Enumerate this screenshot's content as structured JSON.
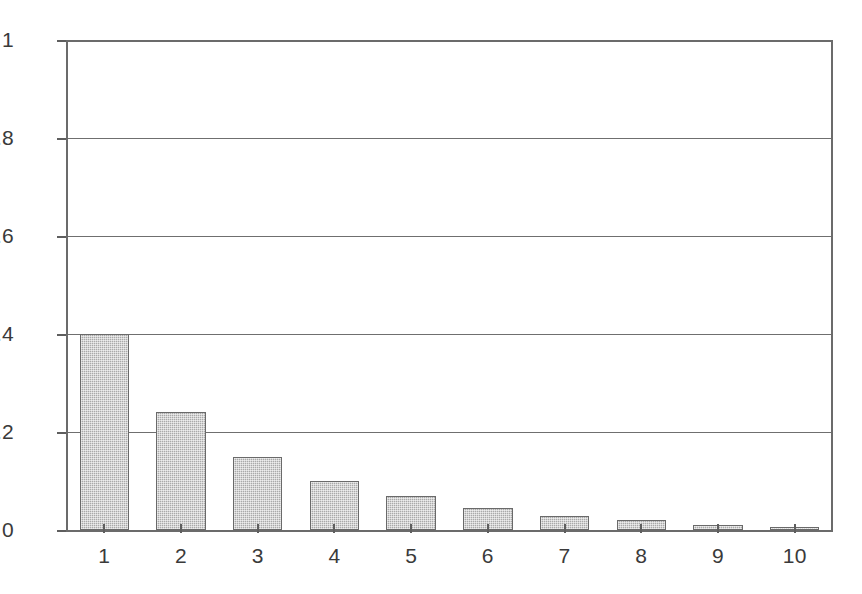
{
  "chart_data": {
    "type": "bar",
    "title": "",
    "subtitle": "",
    "xlabel": "",
    "ylabel": "",
    "categories": [
      "1",
      "2",
      "3",
      "4",
      "5",
      "6",
      "7",
      "8",
      "9",
      "10"
    ],
    "values": [
      0.4,
      0.24,
      0.15,
      0.1,
      0.07,
      0.045,
      0.028,
      0.02,
      0.011,
      0.005
    ],
    "series": [
      {
        "name": "",
        "values": [
          0.4,
          0.24,
          0.15,
          0.1,
          0.07,
          0.045,
          0.028,
          0.02,
          0.011,
          0.005
        ]
      }
    ],
    "ylim": [
      0,
      1
    ],
    "yticks": [
      0,
      0.2,
      0.4,
      0.6,
      0.8,
      1
    ],
    "ytick_labels": [
      "0",
      "0.2",
      "0.4",
      "0.6",
      "0.8",
      "1"
    ],
    "xtick_labels": [
      "1",
      "2",
      "3",
      "4",
      "5",
      "6",
      "7",
      "8",
      "9",
      "10"
    ],
    "grid": true,
    "grid_axis": "y",
    "legend": false,
    "legend_position": "none",
    "annotations": [],
    "bar_fill_color": "#a9a9a9",
    "bar_edge_color": "#6a6a6a",
    "grid_color": "#6f6f6f",
    "axis_color": "#6b6b6b",
    "text_color": "#3a3a3a",
    "background_color": "#ffffff"
  }
}
